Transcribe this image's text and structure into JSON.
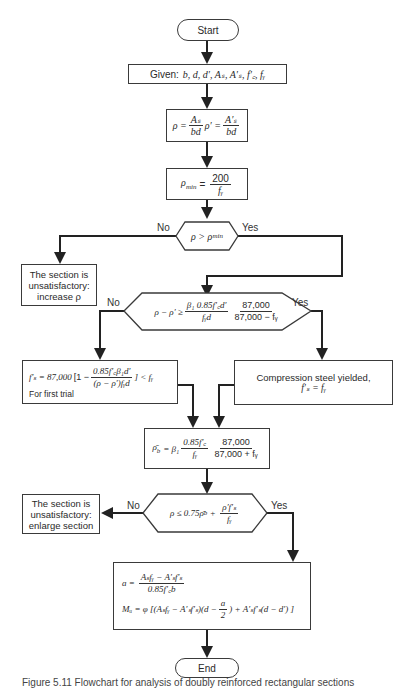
{
  "nodes": {
    "start": {
      "label": "Start"
    },
    "given": {
      "label": "Given:",
      "vars": "b, d, d′, Aₛ, A′ₛ, f′꜀, fᵧ"
    },
    "ratios": {
      "rho": "ρ =",
      "rho_num": "Aₛ",
      "rho_den": "bd",
      "rho_p": "ρ′ =",
      "rho_p_num": "A′ₛ",
      "rho_p_den": "bd"
    },
    "rho_min": {
      "lhs": "ρ",
      "sub": "min",
      "eq": "=",
      "num": "200",
      "den": "fᵧ"
    },
    "decision1": {
      "text": "ρ > ρ",
      "sub": "min",
      "no": "No",
      "yes": "Yes"
    },
    "fail1": {
      "line1": "The section is",
      "line2": "unsatisfactory:",
      "line3": "increase ρ"
    },
    "decision2": {
      "lhs": "ρ − ρ′ ≥",
      "num1": "β₁ 0.85f′꜀d′",
      "den1": "fᵧd",
      "num2": "87,000",
      "den2": "87,000 − fᵧ",
      "no": "No",
      "yes": "Yes"
    },
    "fs_trial": {
      "lhs": "f′ₛ = 87,000",
      "bracket_open": "[1 −",
      "num": "0.85f′꜀β₁d′",
      "den": "(ρ − ρ′)fᵧd",
      "bracket_close": "] < fᵧ",
      "note": "For first trial"
    },
    "yielded": {
      "line1": "Compression steel yielded,",
      "line2": "f′ₛ = fᵧ"
    },
    "rho_b": {
      "lhs": "ρ̄",
      "sub": "b",
      "eq": "= β₁",
      "num1": "0.85f′꜀",
      "den1": "fᵧ",
      "num2": "87,000",
      "den2": "87,000 + fᵧ"
    },
    "decision3": {
      "lhs": "ρ ≤ 0.75ρ̄",
      "sub": "b",
      "plus": "+",
      "num": "ρ′f′ₛ",
      "den": "fᵧ",
      "no": "No",
      "yes": "Yes"
    },
    "fail2": {
      "line1": "The section is",
      "line2": "unsatisfactory:",
      "line3": "enlarge section"
    },
    "result": {
      "a_lhs": "a =",
      "a_num": "Aₛfᵧ − A′ₛf′ₛ",
      "a_den": "0.85f′꜀b",
      "mu_lhs": "Mᵤ = φ [(Aₛfᵧ − A′ₛf′ₛ)(d −",
      "mu_frac_num": "a",
      "mu_frac_den": "2",
      "mu_rhs": ") + A′ₛf′ₛ(d − d′) ]"
    },
    "end": {
      "label": "End"
    }
  },
  "caption": "Figure 5.11 Flowchart for analysis of doubly reinforced rectangular sections"
}
